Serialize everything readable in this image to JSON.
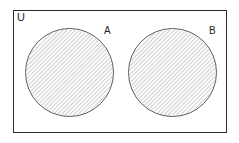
{
  "figure": {
    "type": "venn-diagram",
    "background_color": "#ffffff",
    "rectangle": {
      "label": "U",
      "name": "universal-set",
      "border_color": "#2b2b2b",
      "fill": "none"
    },
    "sets": [
      {
        "id": "A",
        "label": "A",
        "name": "set-a",
        "shape": "circle",
        "shaded": true,
        "hatch_style": "diagonal-lines",
        "hatch_color": "#9a9a9a",
        "outline_color": "#5a5a5a",
        "center_x": 69,
        "center_y": 72,
        "radius": 44
      },
      {
        "id": "B",
        "label": "B",
        "name": "set-b",
        "shape": "circle",
        "shaded": true,
        "hatch_style": "diagonal-lines",
        "hatch_color": "#9a9a9a",
        "outline_color": "#5a5a5a",
        "center_x": 172,
        "center_y": 72,
        "radius": 44
      }
    ]
  }
}
